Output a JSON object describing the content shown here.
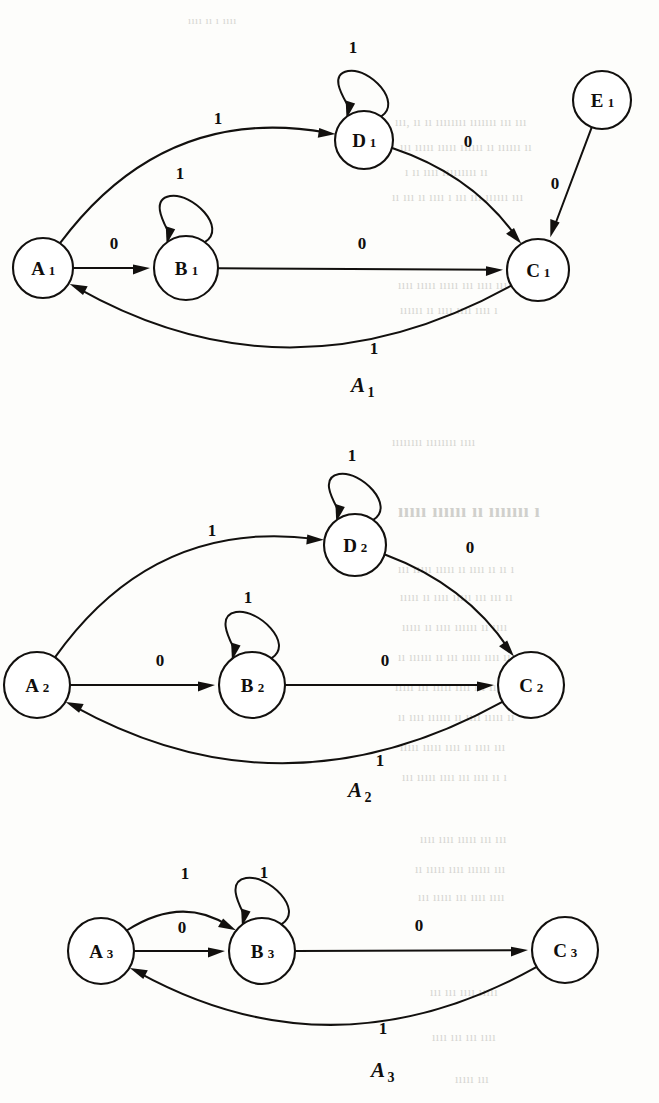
{
  "page": {
    "kind": "scanned-book-figure",
    "ink_color": "#12100e",
    "paper_color": "#fdfdfb",
    "bleed_color": "#cfcfca"
  },
  "automata": [
    {
      "id": "A1",
      "caption": "A",
      "caption_subscript": "1",
      "caption_x": 358,
      "caption_y": 392,
      "nodes": [
        {
          "id": "A1",
          "letter": "A",
          "subscript": "1",
          "cx": 43,
          "cy": 268,
          "r": 30
        },
        {
          "id": "B1",
          "letter": "B",
          "subscript": "1",
          "cx": 186,
          "cy": 268,
          "r": 32
        },
        {
          "id": "C1",
          "letter": "C",
          "subscript": "1",
          "cx": 538,
          "cy": 270,
          "r": 31
        },
        {
          "id": "D1",
          "letter": "D",
          "subscript": "1",
          "cx": 364,
          "cy": 140,
          "r": 29
        },
        {
          "id": "E1",
          "letter": "E",
          "subscript": "1",
          "cx": 602,
          "cy": 100,
          "r": 29
        }
      ],
      "transitions": [
        {
          "from": "A1",
          "to": "D1",
          "symbol": "1",
          "shape": "arc-top",
          "label_x": 218,
          "label_y": 118
        },
        {
          "from": "D1",
          "to": "D1",
          "symbol": "1",
          "shape": "self-loop-top",
          "label_x": 353,
          "label_y": 47
        },
        {
          "from": "D1",
          "to": "C1",
          "symbol": "0",
          "shape": "arc-right",
          "label_x": 468,
          "label_y": 141
        },
        {
          "from": "E1",
          "to": "C1",
          "symbol": "0",
          "shape": "straight",
          "label_x": 555,
          "label_y": 183
        },
        {
          "from": "A1",
          "to": "B1",
          "symbol": "0",
          "shape": "straight",
          "label_x": 114,
          "label_y": 243
        },
        {
          "from": "B1",
          "to": "B1",
          "symbol": "1",
          "shape": "self-loop-top",
          "label_x": 180,
          "label_y": 173
        },
        {
          "from": "B1",
          "to": "C1",
          "symbol": "0",
          "shape": "straight",
          "label_x": 362,
          "label_y": 243
        },
        {
          "from": "C1",
          "to": "A1",
          "symbol": "1",
          "shape": "arc-bottom",
          "label_x": 374,
          "label_y": 348
        }
      ]
    },
    {
      "id": "A2",
      "caption": "A",
      "caption_subscript": "2",
      "caption_x": 355,
      "caption_y": 797,
      "nodes": [
        {
          "id": "A2",
          "letter": "A",
          "subscript": "2",
          "cx": 37,
          "cy": 685,
          "r": 33
        },
        {
          "id": "B2",
          "letter": "B",
          "subscript": "2",
          "cx": 252,
          "cy": 685,
          "r": 33
        },
        {
          "id": "C2",
          "letter": "C",
          "subscript": "2",
          "cx": 531,
          "cy": 685,
          "r": 33
        },
        {
          "id": "D2",
          "letter": "D",
          "subscript": "2",
          "cx": 355,
          "cy": 545,
          "r": 31
        }
      ],
      "transitions": [
        {
          "from": "A2",
          "to": "D2",
          "symbol": "1",
          "shape": "arc-top",
          "label_x": 212,
          "label_y": 530
        },
        {
          "from": "D2",
          "to": "D2",
          "symbol": "1",
          "shape": "self-loop-top",
          "label_x": 352,
          "label_y": 455
        },
        {
          "from": "D2",
          "to": "C2",
          "symbol": "0",
          "shape": "arc-right",
          "label_x": 470,
          "label_y": 547
        },
        {
          "from": "A2",
          "to": "B2",
          "symbol": "0",
          "shape": "straight",
          "label_x": 160,
          "label_y": 660
        },
        {
          "from": "B2",
          "to": "B2",
          "symbol": "1",
          "shape": "self-loop-top",
          "label_x": 248,
          "label_y": 597
        },
        {
          "from": "B2",
          "to": "C2",
          "symbol": "0",
          "shape": "straight",
          "label_x": 385,
          "label_y": 660
        },
        {
          "from": "C2",
          "to": "A2",
          "symbol": "1",
          "shape": "arc-bottom",
          "label_x": 380,
          "label_y": 760
        }
      ]
    },
    {
      "id": "A3",
      "caption": "A",
      "caption_subscript": "3",
      "caption_x": 378,
      "caption_y": 1077,
      "nodes": [
        {
          "id": "A3",
          "letter": "A",
          "subscript": "3",
          "cx": 101,
          "cy": 951,
          "r": 33
        },
        {
          "id": "B3",
          "letter": "B",
          "subscript": "3",
          "cx": 262,
          "cy": 951,
          "r": 33
        },
        {
          "id": "C3",
          "letter": "C",
          "subscript": "3",
          "cx": 565,
          "cy": 950,
          "r": 33
        }
      ],
      "transitions": [
        {
          "from": "A3",
          "to": "B3",
          "symbol": "1",
          "shape": "arc-top",
          "label_x": 185,
          "label_y": 873
        },
        {
          "from": "A3",
          "to": "B3",
          "symbol": "0",
          "shape": "straight",
          "label_x": 182,
          "label_y": 927
        },
        {
          "from": "B3",
          "to": "B3",
          "symbol": "1",
          "shape": "self-loop-top",
          "label_x": 264,
          "label_y": 872
        },
        {
          "from": "B3",
          "to": "C3",
          "symbol": "0",
          "shape": "straight",
          "label_x": 419,
          "label_y": 925
        },
        {
          "from": "C3",
          "to": "A3",
          "symbol": "1",
          "shape": "arc-bottom",
          "label_x": 383,
          "label_y": 1028
        }
      ]
    }
  ],
  "bleed_through_text": [
    {
      "text": "ıııı  ıı  ı  ıııı",
      "x": 188,
      "y": 14,
      "size": 11
    },
    {
      "text": "ııı, ıı ıı  ıııııııı  ııııııı  ııı  ııı",
      "x": 395,
      "y": 115,
      "size": 12
    },
    {
      "text": "ııı ııııı ııııı ıııııı ıı ıııııı ıı",
      "x": 400,
      "y": 140,
      "size": 12
    },
    {
      "text": "ı ıı ıııı ııııııııı ıı",
      "x": 405,
      "y": 165,
      "size": 12
    },
    {
      "text": "ıı ııı ıı ıııı ı ııı ııı ıııııı ııı",
      "x": 392,
      "y": 190,
      "size": 12
    },
    {
      "text": "ıııı ııııı ııııı ııı ıııı ııı ııı",
      "x": 398,
      "y": 278,
      "size": 12
    },
    {
      "text": "ıııııı ıı ıııı ıııı ıııı ı",
      "x": 400,
      "y": 303,
      "size": 12
    },
    {
      "text": "ıııııııı ıııııııı ıııı",
      "x": 392,
      "y": 435,
      "size": 12
    },
    {
      "text": "ııııı  ıııııı  ıı  ııııııı  ı",
      "x": 398,
      "y": 500,
      "size": 19
    },
    {
      "text": "ııı ııııı ııııı ıı ıııı ıı ıı ı",
      "x": 398,
      "y": 562,
      "size": 12
    },
    {
      "text": "ııııı ıı ıııı ııııı ııı ııı ıı",
      "x": 400,
      "y": 590,
      "size": 12
    },
    {
      "text": "ııııı ıı ıııı ıııııı ıı ıııı",
      "x": 402,
      "y": 620,
      "size": 12
    },
    {
      "text": "ıı ıııııı ıı ııı ııııı ıııı ıı",
      "x": 398,
      "y": 650,
      "size": 12
    },
    {
      "text": "ııııı ııı ııııı ıııı ııı ıı ıı",
      "x": 395,
      "y": 680,
      "size": 12
    },
    {
      "text": "ıı ıııı ıııııı ıı ıııı ııııı ıı",
      "x": 398,
      "y": 710,
      "size": 12
    },
    {
      "text": "ııııı ııııı ıııı ıı ıııı ııı",
      "x": 400,
      "y": 740,
      "size": 12
    },
    {
      "text": "ııı ııııı ıııı ııı ıııı ıı ı",
      "x": 402,
      "y": 770,
      "size": 12
    },
    {
      "text": "ıııı ıııı ııııı ııı ııı",
      "x": 420,
      "y": 832,
      "size": 12
    },
    {
      "text": "ıı ııııı ıııı ıııııı ııı",
      "x": 415,
      "y": 862,
      "size": 12
    },
    {
      "text": "ııı ııııı ııı ıııı ıııı",
      "x": 418,
      "y": 890,
      "size": 12
    },
    {
      "text": "ııı ııı ıııı ııııı",
      "x": 430,
      "y": 985,
      "size": 12
    },
    {
      "text": "ıııı ııı ııı ıııı",
      "x": 432,
      "y": 1030,
      "size": 12
    },
    {
      "text": "ııııı ııı",
      "x": 455,
      "y": 1072,
      "size": 12
    }
  ]
}
